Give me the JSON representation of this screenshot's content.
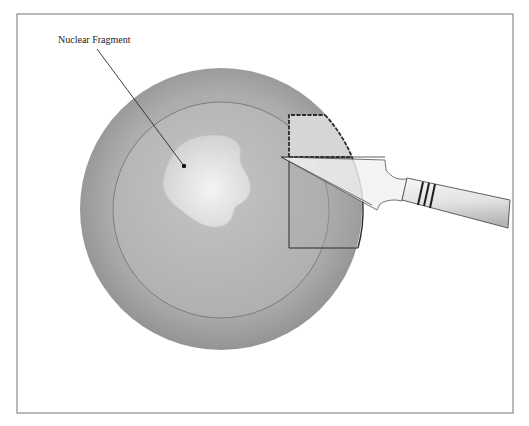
{
  "diagram": {
    "labels": {
      "nuclear_fragment": "Nuclear Fragment"
    },
    "colors": {
      "frame": "#8a8a8a",
      "outer_disc_edge": "#8f8f8f",
      "outer_disc_center": "#b8b8b8",
      "inner_ring_stroke": "#6e6e6e",
      "nucleus_center": "#f2f2f2",
      "nucleus_edge": "#d6d6d6",
      "flap_fill": "#d4d4d4",
      "outline": "#2a2a2a",
      "instrument_fill": "#f0f0f0",
      "handle_dark": "#bdbdbd",
      "handle_light": "#f7f7f7"
    },
    "geometry": {
      "frame": {
        "x": 17,
        "y": 14,
        "w": 496,
        "h": 399
      },
      "outer_circle": {
        "cx": 221,
        "cy": 209,
        "r": 141
      },
      "inner_circle": {
        "cx": 221,
        "cy": 210,
        "r": 108
      },
      "leader_line": {
        "x1": 97,
        "y1": 49,
        "x2": 184,
        "y2": 166
      },
      "leader_dot": {
        "cx": 184,
        "cy": 166,
        "r": 2.2
      }
    }
  }
}
